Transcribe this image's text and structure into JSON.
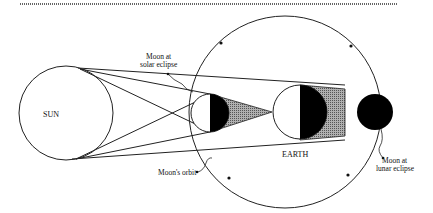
{
  "diagram": {
    "labels": {
      "sun": "SUN",
      "earth": "EARTH",
      "moon_solar_line1": "Moon at",
      "moon_solar_line2": "solar eclipse",
      "moon_lunar_line1": "Moon at",
      "moon_lunar_line2": "lunar eclipse",
      "moon_orbit": "Moon's orbit"
    },
    "colors": {
      "line": "#222222",
      "shadow_umbra": "#000000",
      "shadow_penumbra": "#8a8a8a",
      "background": "#ffffff"
    }
  }
}
